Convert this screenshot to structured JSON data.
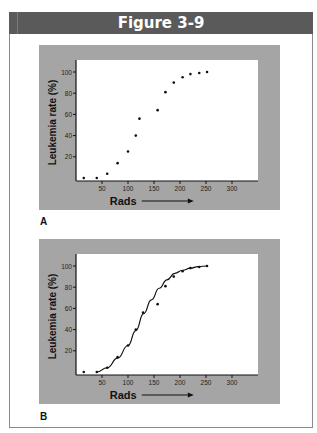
{
  "figure": {
    "title": "Figure 3-9",
    "panels": [
      {
        "label": "A"
      },
      {
        "label": "B"
      }
    ]
  },
  "colors": {
    "header_bg": "#5a5a5a",
    "panel_bg": "#a5a5a5",
    "plot_bg": "#ffffff",
    "ink": "#111111"
  },
  "chart_data": [
    {
      "type": "scatter",
      "panel": "A",
      "title": "",
      "xlabel": "Rads",
      "ylabel": "Leukemia rate (%)",
      "xticks": [
        50,
        100,
        150,
        200,
        250,
        300
      ],
      "yticks": [
        20,
        40,
        60,
        80,
        100
      ],
      "xlim": [
        0,
        340
      ],
      "ylim": [
        0,
        110
      ],
      "grid": false,
      "legend": null,
      "x": [
        15,
        40,
        60,
        80,
        100,
        115,
        122,
        157,
        172,
        188,
        205,
        220,
        237,
        252
      ],
      "y": [
        0,
        0,
        4,
        14,
        25,
        40,
        56,
        64,
        81,
        90,
        95,
        98,
        99,
        100
      ]
    },
    {
      "type": "scatter",
      "panel": "B",
      "title": "",
      "xlabel": "Rads",
      "ylabel": "Leukemia rate (%)",
      "xticks": [
        50,
        100,
        150,
        200,
        250,
        300
      ],
      "yticks": [
        20,
        40,
        60,
        80,
        100
      ],
      "xlim": [
        0,
        340
      ],
      "ylim": [
        0,
        110
      ],
      "grid": false,
      "legend": null,
      "x": [
        15,
        40,
        60,
        80,
        100,
        115,
        129,
        157,
        172,
        188,
        205,
        220,
        237,
        252
      ],
      "y": [
        0,
        0,
        4,
        14,
        25,
        40,
        56,
        64,
        81,
        90,
        95,
        98,
        99,
        100
      ],
      "fit_curve": {
        "type": "sigmoid",
        "x": [
          40,
          60,
          80,
          100,
          115,
          130,
          145,
          160,
          175,
          190,
          205,
          220,
          235,
          252
        ],
        "y": [
          0,
          4,
          13,
          25,
          39,
          55,
          68,
          79,
          87,
          93,
          96,
          98,
          99.5,
          100
        ]
      }
    }
  ]
}
